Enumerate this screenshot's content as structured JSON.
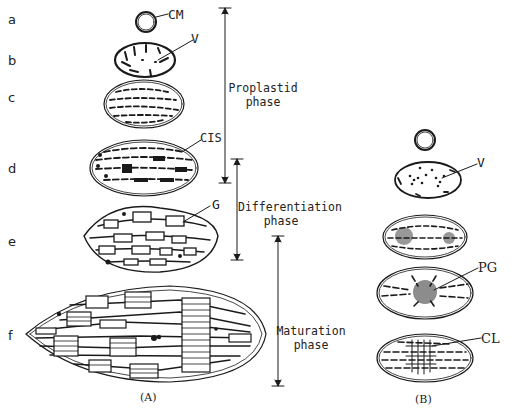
{
  "figure": {
    "panel_a": {
      "caption": "(A)",
      "rows": [
        {
          "id": "a",
          "label": "a"
        },
        {
          "id": "b",
          "label": "b"
        },
        {
          "id": "c",
          "label": "c"
        },
        {
          "id": "d",
          "label": "d"
        },
        {
          "id": "e",
          "label": "e"
        },
        {
          "id": "f",
          "label": "f"
        }
      ],
      "annotations": {
        "cm": "CM",
        "v": "V",
        "cis": "CIS",
        "g": "G"
      },
      "phases": [
        {
          "line1": "Proplastid",
          "line2": "phase"
        },
        {
          "line1": "Differentiation",
          "line2": "phase"
        },
        {
          "line1": "Maturation",
          "line2": "phase"
        }
      ]
    },
    "panel_b": {
      "caption": "(B)",
      "annotations": {
        "v": "V",
        "pg": "PG",
        "cl": "CL"
      }
    }
  }
}
